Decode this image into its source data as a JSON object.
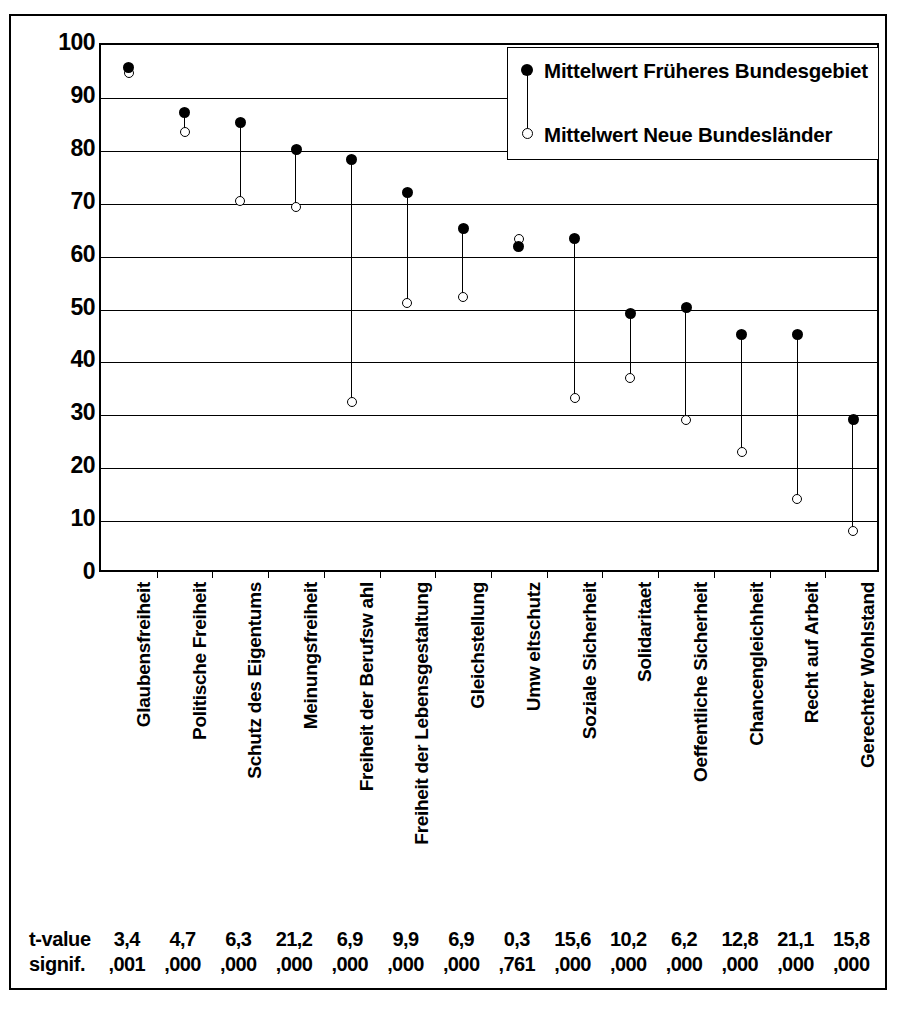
{
  "chart_data": {
    "type": "scatter",
    "title": "",
    "xlabel": "",
    "ylabel": "",
    "ylim": [
      0,
      100
    ],
    "yticks": [
      100,
      90,
      80,
      70,
      60,
      50,
      40,
      30,
      20,
      10,
      0
    ],
    "grid": true,
    "legend_position": "top-right",
    "categories": [
      "Glaubensfreiheit",
      "Politische Freiheit",
      "Schutz des Eigentums",
      "Meinungsfreiheit",
      "Freiheit der Berufsw ahl",
      "Freiheit der Lebensgestaltung",
      "Gleichstellung",
      "Umw eltschutz",
      "Soziale Sicherheit",
      "Solidaritaet",
      "Oeffentliche Sicherheit",
      "Chancengleichheit",
      "Recht auf Arbeit",
      "Gerechter Wohlstand"
    ],
    "series": [
      {
        "name": "Mittelwert Früheres Bundesgebiet",
        "marker": "filled-circle",
        "values": [
          95.8,
          87.2,
          85.4,
          80.2,
          78.4,
          72.2,
          65.4,
          62.0,
          63.4,
          49.2,
          50.3,
          45.3,
          45.3,
          29.2
        ]
      },
      {
        "name": "Mittelwert Neue Bundesländer",
        "marker": "open-circle",
        "values": [
          94.8,
          83.5,
          70.5,
          69.3,
          32.5,
          51.3,
          52.3,
          63.3,
          33.2,
          37.1,
          29.1,
          23.1,
          14.2,
          8.2
        ]
      }
    ],
    "t_values": [
      "3,4",
      "4,7",
      "6,3",
      "21,2",
      "6,9",
      "9,9",
      "6,9",
      "0,3",
      "15,6",
      "10,2",
      "6,2",
      "12,8",
      "21,1",
      "15,8"
    ],
    "significance": [
      ",001",
      ",000",
      ",000",
      ",000",
      ",000",
      ",000",
      ",000",
      ",761",
      ",000",
      ",000",
      ",000",
      ",000",
      ",000",
      ",000"
    ]
  },
  "legend": {
    "item1_label": "Mittelwert Früheres Bundesgebiet",
    "item2_label": "Mittelwert Neue Bundesländer"
  },
  "stats": {
    "row1_label": "t-value",
    "row2_label": "signif."
  },
  "colors": {
    "ink": "#000000",
    "background": "#ffffff"
  }
}
